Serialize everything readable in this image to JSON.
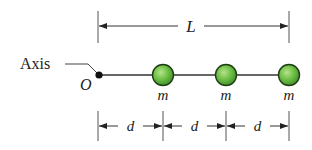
{
  "diagram": {
    "labels": {
      "axis": "Axis",
      "origin": "O",
      "length": "L",
      "mass": "m",
      "spacing": "d"
    },
    "masses": [
      {
        "label": "m",
        "cx": 163
      },
      {
        "label": "m",
        "cx": 226
      },
      {
        "label": "m",
        "cx": 289
      }
    ],
    "spacings": [
      {
        "label": "d",
        "x1": 98,
        "x2": 163
      },
      {
        "label": "d",
        "x1": 163,
        "x2": 226
      },
      {
        "label": "d",
        "x1": 226,
        "x2": 289
      }
    ],
    "colors": {
      "mass_fill_light": "#9ed66a",
      "mass_fill_dark": "#3f8f2a",
      "mass_stroke": "#1f3d14",
      "line": "#333333"
    }
  }
}
